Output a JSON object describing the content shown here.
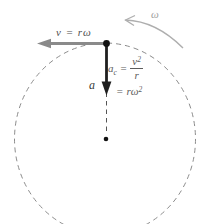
{
  "figure": {
    "labels": {
      "velocity": "v = rω",
      "omega": "ω",
      "acceleration": "a",
      "ac_base": "a",
      "ac_sub": "c",
      "ac_equals": "=",
      "frac_num_base": "v",
      "frac_num_sup": "2",
      "frac_den": "r",
      "line2_equals": "=",
      "line2_base": "rω",
      "line2_sup": "2"
    },
    "colors": {
      "background": "#ffffff",
      "circle_dash": "#8c8c8c",
      "radius_dash": "#555555",
      "velocity_arrow": "#8a8a8a",
      "acceleration_arrow": "#1f1f1f",
      "omega_arrow": "#aeaeae",
      "formula_text": "#5c5c5c",
      "label_text": "#4f4f4f",
      "dot": "#111111"
    }
  }
}
